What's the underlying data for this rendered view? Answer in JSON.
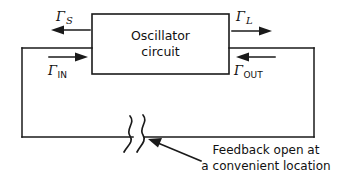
{
  "figure": {
    "type": "circuit-block-diagram",
    "background_color": "#ffffff",
    "line_color": "#1a1a1a"
  },
  "block": {
    "label_line1": "Oscillator",
    "label_line2": "circuit"
  },
  "ports": [
    {
      "id": "gamma-s",
      "symbol": "Γ",
      "subscript": "S",
      "subscript_style": "italic",
      "arrow_direction": "left",
      "position": "top-left"
    },
    {
      "id": "gamma-in",
      "symbol": "Γ",
      "subscript": "IN",
      "subscript_style": "upright",
      "arrow_direction": "right",
      "position": "bottom-left"
    },
    {
      "id": "gamma-l",
      "symbol": "Γ",
      "subscript": "L",
      "subscript_style": "italic",
      "arrow_direction": "right",
      "position": "top-right"
    },
    {
      "id": "gamma-out",
      "symbol": "Γ",
      "subscript": "OUT",
      "subscript_style": "upright",
      "arrow_direction": "left",
      "position": "bottom-right"
    }
  ],
  "annotation": {
    "line1": "Feedback open at",
    "line2": "a convenient location",
    "pointer": "arrow-pointing-up-left-to-break"
  },
  "break_marker": {
    "name": "squiggle-break",
    "description": "two wavy lines crossing the feedback loop conductor"
  }
}
